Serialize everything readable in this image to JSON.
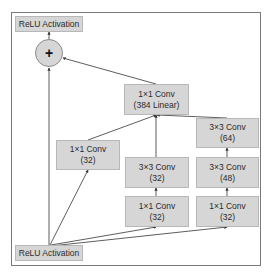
{
  "diagram": {
    "nodes": {
      "relu_out": {
        "label": "ReLU Activation"
      },
      "add": {
        "symbol": "+",
        "icon": "plus-icon"
      },
      "conv_linear": {
        "line1": "1×1 Conv",
        "line2": "(384 Linear)"
      },
      "branch1_conv1": {
        "line1": "1×1 Conv",
        "line2": "(32)"
      },
      "branch2_conv1": {
        "line1": "1×1 Conv",
        "line2": "(32)"
      },
      "branch2_conv2": {
        "line1": "3×3 Conv",
        "line2": "(32)"
      },
      "branch3_conv1": {
        "line1": "1×1 Conv",
        "line2": "(32)"
      },
      "branch3_conv2": {
        "line1": "3×3 Conv",
        "line2": "(48)"
      },
      "branch3_conv3": {
        "line1": "3×3 Conv",
        "line2": "(64)"
      },
      "relu_in": {
        "label": "ReLU Activation"
      }
    },
    "edges": [
      [
        "relu_in",
        "add"
      ],
      [
        "relu_in",
        "branch1_conv1"
      ],
      [
        "relu_in",
        "branch2_conv1"
      ],
      [
        "relu_in",
        "branch3_conv1"
      ],
      [
        "branch2_conv1",
        "branch2_conv2"
      ],
      [
        "branch3_conv1",
        "branch3_conv2"
      ],
      [
        "branch3_conv2",
        "branch3_conv3"
      ],
      [
        "branch1_conv1",
        "conv_linear"
      ],
      [
        "branch2_conv2",
        "conv_linear"
      ],
      [
        "branch3_conv3",
        "conv_linear"
      ],
      [
        "conv_linear",
        "add"
      ],
      [
        "add",
        "relu_out"
      ]
    ],
    "colors": {
      "node_fill": "#d6d6d6",
      "node_border": "#b8b8b8",
      "edge": "#333333",
      "frame": "#7a7a7a"
    }
  }
}
